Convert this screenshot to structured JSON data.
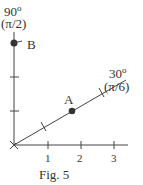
{
  "figure": {
    "caption": "Fig. 5",
    "vertical_axis": {
      "angle_deg": "90",
      "degree_sign": "o",
      "angle_rad": "(π/2)"
    },
    "diagonal_axis": {
      "angle_deg": "30",
      "degree_sign": "o",
      "angle_rad": "(π/6)"
    },
    "x_ticks": [
      "1",
      "2",
      "3"
    ],
    "points": [
      {
        "label": "A",
        "r": 2,
        "theta_deg": 30
      },
      {
        "label": "B",
        "r": 3,
        "theta_deg": 90
      }
    ],
    "colors": {
      "ink": "#333333",
      "background": "#ffffff"
    }
  }
}
